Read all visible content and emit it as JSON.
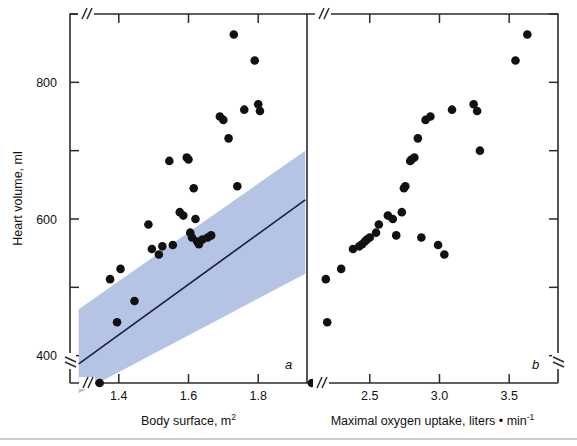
{
  "figure": {
    "background_color": "#ffffff",
    "band_color": "#b5c4e4",
    "point_color": "#111111",
    "line_color": "#1b2340",
    "axis_color": "#2b2b2b"
  },
  "yaxis": {
    "label": "Heart volume, ml",
    "ticks": [
      "400",
      "600",
      "800"
    ],
    "tick_values": [
      400,
      600,
      800
    ],
    "minor_tick_values": [
      500,
      700,
      900
    ],
    "range": [
      360,
      900
    ],
    "has_break": true
  },
  "panels": [
    {
      "letter": "a",
      "xlabel_main": "Body surface, m",
      "xlabel_sup": "2",
      "xlabel_full": "Body surface, m2",
      "ticks": [
        "1.4",
        "1.6",
        "1.8"
      ],
      "tick_values": [
        1.4,
        1.6,
        1.8
      ],
      "range": [
        1.26,
        1.94
      ],
      "has_band": true,
      "has_regression_line": true
    },
    {
      "letter": "b",
      "xlabel_main": "Maximal oxygen uptake, liters • min",
      "xlabel_sup": "-1",
      "xlabel_full": "Maximal oxygen uptake, liters • min-1",
      "ticks": [
        "2.5",
        "3.0",
        "3.5"
      ],
      "tick_values": [
        2.5,
        3.0,
        3.5
      ],
      "range": [
        2.05,
        3.85
      ],
      "has_band": false,
      "has_regression_line": false
    }
  ],
  "chart_data": {
    "type": "scatter",
    "title": "",
    "subtitle": "",
    "panels": [
      {
        "id": "a",
        "label": "a",
        "xlabel": "Body surface, m2",
        "ylabel": "Heart volume, ml",
        "xlim": [
          1.26,
          1.94
        ],
        "ylim": [
          360,
          900
        ],
        "xticks": [
          1.4,
          1.6,
          1.8
        ],
        "yticks": [
          400,
          600,
          800
        ],
        "grid": false,
        "legend": "none",
        "series": [
          {
            "name": "Subjects",
            "x": [
              1.345,
              1.375,
              1.395,
              1.405,
              1.445,
              1.485,
              1.495,
              1.515,
              1.525,
              1.545,
              1.555,
              1.575,
              1.585,
              1.595,
              1.6,
              1.605,
              1.61,
              1.615,
              1.62,
              1.625,
              1.63,
              1.64,
              1.655,
              1.665,
              1.69,
              1.7,
              1.715,
              1.73,
              1.74,
              1.76,
              1.79,
              1.8,
              1.805
            ],
            "y": [
              330,
              512,
              449,
              527,
              480,
              592,
              556,
              548,
              560,
              685,
              562,
              610,
              605,
              690,
              687,
              580,
              573,
              645,
              600,
              567,
              563,
              570,
              573,
              576,
              750,
              745,
              718,
              870,
              648,
              760,
              832,
              768,
              758
            ]
          }
        ],
        "band": {
          "name": "95% prediction band",
          "color": "#b5c4e4",
          "lower_left": [
            1.285,
            345
          ],
          "lower_right": [
            1.935,
            520
          ],
          "upper_left": [
            1.285,
            468
          ],
          "upper_right": [
            1.935,
            700
          ]
        },
        "regression_line": {
          "x": [
            1.285,
            1.935
          ],
          "y": [
            388,
            628
          ]
        },
        "outlier_on_axis": {
          "x": 1.345,
          "y": 330,
          "note": "plotted below axis break"
        }
      },
      {
        "id": "b",
        "label": "b",
        "xlabel": "Maximal oxygen uptake, liters • min-1",
        "ylabel": "Heart volume, ml",
        "xlim": [
          2.05,
          3.85
        ],
        "ylim": [
          360,
          900
        ],
        "xticks": [
          2.5,
          3.0,
          3.5
        ],
        "yticks": [
          400,
          600,
          800
        ],
        "grid": false,
        "legend": "none",
        "series": [
          {
            "name": "Subjects",
            "x": [
              2.085,
              2.185,
              2.195,
              2.295,
              2.38,
              2.425,
              2.445,
              2.465,
              2.48,
              2.5,
              2.545,
              2.565,
              2.63,
              2.665,
              2.69,
              2.73,
              2.745,
              2.755,
              2.79,
              2.8,
              2.82,
              2.845,
              2.87,
              2.9,
              2.935,
              2.99,
              3.035,
              3.09,
              3.245,
              3.27,
              3.29,
              3.545,
              3.63
            ],
            "y": [
              330,
              512,
              449,
              527,
              556,
              560,
              563,
              567,
              570,
              573,
              580,
              592,
              605,
              600,
              576,
              610,
              645,
              648,
              685,
              687,
              690,
              718,
              573,
              745,
              750,
              562,
              548,
              760,
              768,
              758,
              700,
              832,
              870
            ]
          }
        ],
        "outlier_on_axis": {
          "x": 2.085,
          "y": 330,
          "note": "plotted at corner below axis break"
        }
      }
    ]
  }
}
